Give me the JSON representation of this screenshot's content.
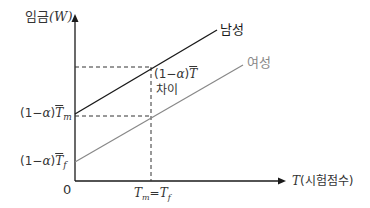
{
  "diagram": {
    "title": "",
    "y_axis_label": "임금",
    "y_axis_symbol": "(W)",
    "x_axis_label_symbol": "T",
    "x_axis_label": "(시험점수)",
    "origin_label": "0",
    "x_tick_label": "T_m = T_f",
    "x_tick": {
      "left": "T",
      "left_sub": "m",
      "eq": "=",
      "right": "T",
      "right_sub": "f"
    },
    "y_tick_upper": {
      "prefix": "(1−",
      "alpha": "α",
      "suffix": ")",
      "T": "T",
      "sub": "m"
    },
    "y_tick_lower": {
      "prefix": "(1−",
      "alpha": "α",
      "suffix": ")",
      "T": "T",
      "sub": "f"
    },
    "gap_annotation": {
      "prefix": "(1−",
      "alpha": "α",
      "suffix": ")",
      "T": "T",
      "caption": "차이"
    },
    "series": [
      {
        "name": "남성",
        "color": "#1a1a1a",
        "start": [
          75,
          114
        ],
        "end": [
          217,
          30
        ]
      },
      {
        "name": "여성",
        "color": "#888888",
        "start": [
          75,
          162
        ],
        "end": [
          243,
          65
        ]
      }
    ],
    "colors": {
      "axis": "#1a1a1a",
      "dashed": "#333333",
      "male": "#1a1a1a",
      "female": "#888888"
    }
  }
}
